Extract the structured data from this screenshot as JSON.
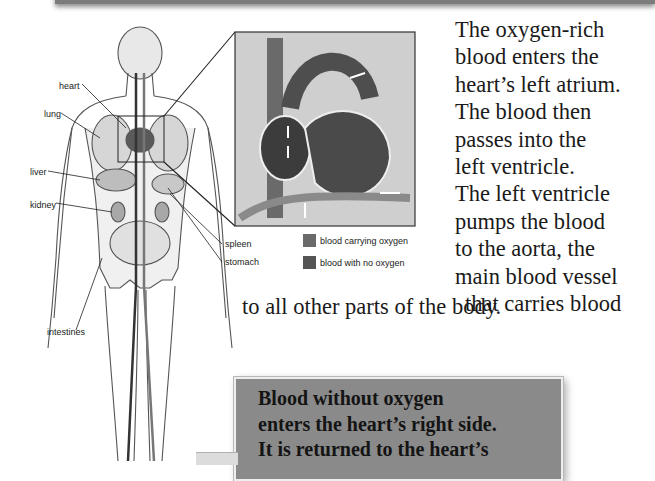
{
  "figure": {
    "organ_labels": [
      {
        "name": "heart",
        "text": "heart",
        "x": 59,
        "y": 81
      },
      {
        "name": "lung",
        "text": "lung",
        "x": 44,
        "y": 109
      },
      {
        "name": "liver",
        "text": "liver",
        "x": 30,
        "y": 167
      },
      {
        "name": "kidney",
        "text": "kidney",
        "x": 30,
        "y": 200
      },
      {
        "name": "spleen",
        "text": "spleen",
        "x": 225,
        "y": 239
      },
      {
        "name": "stomach",
        "text": "stomach",
        "x": 225,
        "y": 257
      },
      {
        "name": "intestines",
        "text": "intestines",
        "x": 47,
        "y": 327
      }
    ],
    "legend": [
      {
        "label": "blood carrying oxygen",
        "color": "#6a6a6a"
      },
      {
        "label": "blood with no oxygen",
        "color": "#555555"
      }
    ]
  },
  "text": {
    "paragraph_lines": [
      "The oxygen-rich",
      "blood enters the",
      "heart’s left atrium.",
      "The blood then",
      "passes into the",
      "left ventricle.",
      "The left ventricle",
      "pumps the blood",
      "to the aorta, the",
      "main blood vessel",
      "that carries blood"
    ],
    "paragraph_last_line": "to all other parts of the body."
  },
  "callout": {
    "lines": [
      "Blood without oxygen",
      "enters the heart’s right side.",
      "It is returned to the heart’s"
    ],
    "background": "#8a8a8a"
  }
}
